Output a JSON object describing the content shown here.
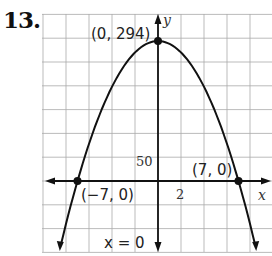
{
  "problem": {
    "number": "13."
  },
  "chart_data": {
    "type": "line",
    "title": "",
    "function": "y = -6x^2 + 294",
    "xlabel": "x",
    "ylabel": "y",
    "x_tick_step": 2,
    "y_tick_step": 50,
    "tick_labels": {
      "x": "2",
      "y": "50"
    },
    "xlim": [
      -10.5,
      9.9
    ],
    "ylim": [
      -300,
      350
    ],
    "grid": true,
    "points": [
      {
        "label": "(0, 294)",
        "x": 0,
        "y": 294
      },
      {
        "label": "(−7, 0)",
        "x": -7,
        "y": 0
      },
      {
        "label": "(7, 0)",
        "x": 7,
        "y": 0
      }
    ],
    "axis_of_symmetry": {
      "label": "x = 0",
      "x": 0
    },
    "series": [
      {
        "name": "parabola",
        "x": [
          -8.5,
          -7,
          -5,
          -3,
          0,
          3,
          5,
          7,
          8.5
        ],
        "values": [
          -139.5,
          0,
          144,
          240,
          294,
          240,
          144,
          0,
          -139.5
        ]
      }
    ]
  }
}
